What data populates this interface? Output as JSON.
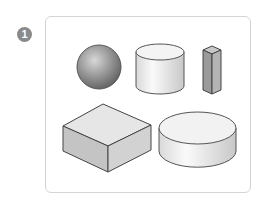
{
  "figure": {
    "label": "1",
    "shapes": [
      {
        "id": "sphere",
        "name": "sphere"
      },
      {
        "id": "cylinder-tall",
        "name": "cylinder"
      },
      {
        "id": "prism-tall",
        "name": "square prism"
      },
      {
        "id": "cuboid",
        "name": "cuboid"
      },
      {
        "id": "cylinder-flat",
        "name": "cylinder"
      }
    ]
  }
}
